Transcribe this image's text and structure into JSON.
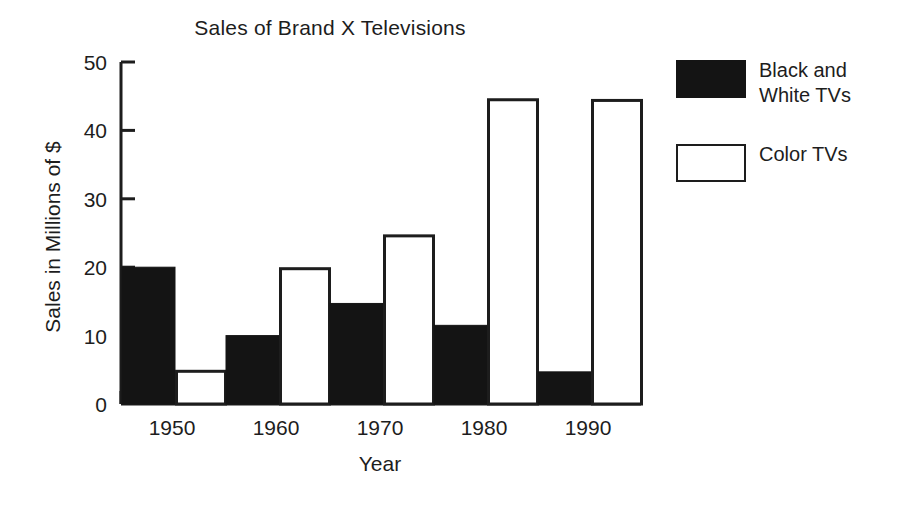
{
  "chart_data": {
    "type": "bar",
    "title": "Sales of Brand X Televisions",
    "xlabel": "Year",
    "ylabel": "Sales in Millions of $",
    "categories": [
      "1950",
      "1960",
      "1970",
      "1980",
      "1990"
    ],
    "series": [
      {
        "name": "Black and White TVs",
        "color": "#141414",
        "fill": "solid",
        "values": [
          20.0,
          10.0,
          14.7,
          11.5,
          4.7
        ]
      },
      {
        "name": "Color TVs",
        "color": "#ffffff",
        "fill": "hollow",
        "values": [
          5.0,
          20.0,
          24.8,
          44.7,
          44.6
        ]
      }
    ],
    "ylim": [
      0,
      50
    ],
    "yticks": [
      0,
      10,
      20,
      30,
      40,
      50
    ],
    "ytick_labels": [
      "0",
      "10",
      "20",
      "30",
      "40",
      "50"
    ],
    "grid": false,
    "legend_position": "right"
  },
  "legend": {
    "items": [
      {
        "label": "Black and White TVs",
        "style": "filled"
      },
      {
        "label": "Color TVs",
        "style": "hollow"
      }
    ]
  }
}
